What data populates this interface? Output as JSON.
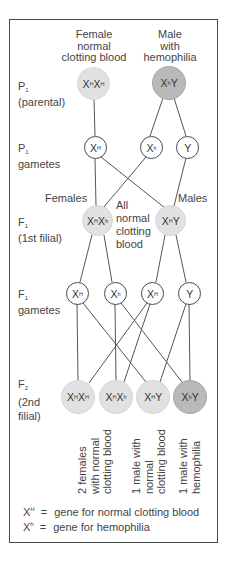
{
  "title_columns": {
    "female": [
      "Female",
      "normal",
      "clotting blood"
    ],
    "male": [
      "Male",
      "with",
      "hemophilia"
    ]
  },
  "generation_labels": {
    "p1": {
      "letter": "P",
      "sub": "1",
      "desc": "(parental)"
    },
    "p1_gametes": {
      "letter": "P",
      "sub": "1",
      "desc": "gametes"
    },
    "f1": {
      "letter": "F",
      "sub": "1",
      "desc": "(1st filial)"
    },
    "f1_gametes": {
      "letter": "F",
      "sub": "1",
      "desc": "gametes"
    },
    "f2": {
      "letter": "F",
      "sub": "2",
      "desc1": "(2nd",
      "desc2": "filial)"
    }
  },
  "nodes": {
    "p1_female": {
      "g1": "X",
      "s1": "H",
      "g2": "X",
      "s2": "H"
    },
    "p1_male": {
      "g1": "X",
      "s1": "h",
      "g2": "Y"
    },
    "p1_gamete_1": {
      "g": "X",
      "s": "H"
    },
    "p1_gamete_2": {
      "g": "X",
      "s": "h"
    },
    "p1_gamete_3": {
      "g": "Y"
    },
    "f1_female": {
      "g1": "X",
      "s1": "H",
      "g2": "X",
      "s2": "h"
    },
    "f1_male": {
      "g1": "X",
      "s1": "H",
      "g2": "Y"
    },
    "f1_gamete_1": {
      "g": "X",
      "s": "H"
    },
    "f1_gamete_2": {
      "g": "X",
      "s": "h"
    },
    "f1_gamete_3": {
      "g": "X",
      "s": "H"
    },
    "f1_gamete_4": {
      "g": "Y"
    },
    "f2_1": {
      "g1": "X",
      "s1": "H",
      "g2": "X",
      "s2": "H"
    },
    "f2_2": {
      "g1": "X",
      "s1": "H",
      "g2": "X",
      "s2": "h"
    },
    "f2_3": {
      "g1": "X",
      "s1": "H",
      "g2": "Y"
    },
    "f2_4": {
      "g1": "X",
      "s1": "h",
      "g2": "Y"
    }
  },
  "annotations": {
    "females": "Females",
    "males": "Males",
    "all_normal": [
      "All",
      "normal",
      "clotting",
      "blood"
    ]
  },
  "outcomes": [
    [
      "2 females",
      "with normal",
      "clotting blood"
    ],
    [
      "1 male with",
      "normal",
      "clotting blood"
    ],
    [
      "1 male with",
      "hemophilia"
    ]
  ],
  "legend": [
    {
      "g": "X",
      "s": "H",
      "eq": "=",
      "text": "gene for normal clotting blood"
    },
    {
      "g": "X",
      "s": "h",
      "eq": "=",
      "text": "gene for hemophilia"
    }
  ],
  "colors": {
    "normal_fill": "#e1e1e1",
    "hemophilia_fill": "#b9b9b9",
    "line": "#555555"
  }
}
